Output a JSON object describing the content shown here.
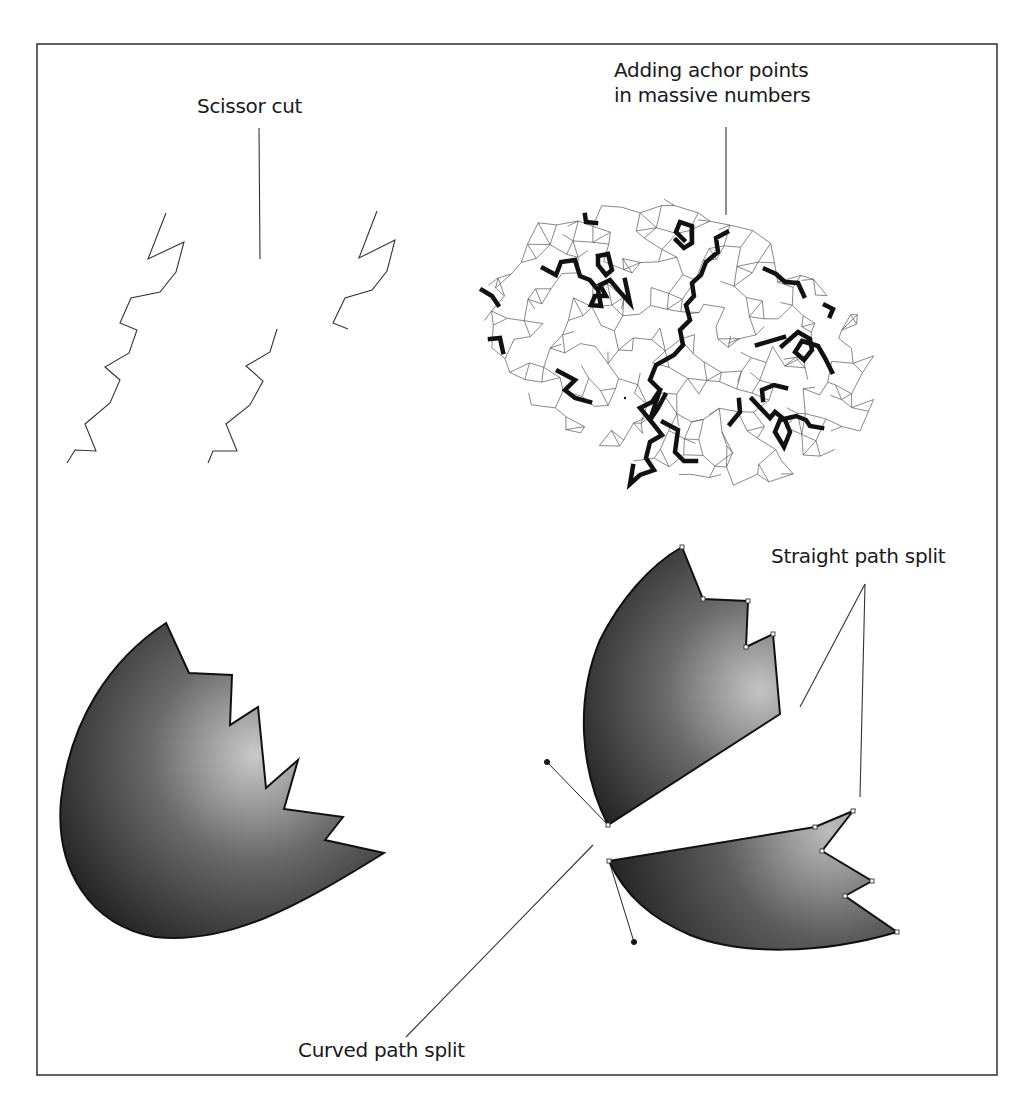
{
  "diagram": {
    "labels": {
      "scissor_cut": "Scissor cut",
      "anchor_line1": "Adding achor points",
      "anchor_line2": "in massive numbers",
      "straight_split": "Straight path split",
      "curved_split": "Curved path split"
    },
    "panels": [
      {
        "id": "scissor-cut",
        "description": "Zigzag open path cut into three pieces"
      },
      {
        "id": "anchor-points",
        "description": "Elliptical mesh of many thin paths with bold highlighted segments"
      },
      {
        "id": "whole-shape",
        "description": "Gradient-filled egg shape with jagged edge"
      },
      {
        "id": "split-shape",
        "description": "Same shape split into two pieces showing anchor points and bezier handles"
      }
    ],
    "colors": {
      "frame": "#3a3a3a",
      "stroke": "#222222",
      "gradient_light": "#c8c8c8",
      "gradient_dark": "#1e1e1e",
      "text": "#1a1a1a"
    }
  }
}
